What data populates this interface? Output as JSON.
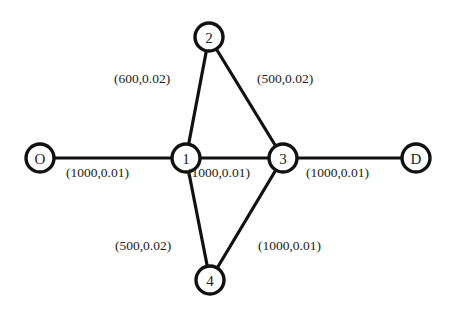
{
  "diagram": {
    "type": "network-graph",
    "nodes": [
      {
        "id": "O",
        "label": "O",
        "x": 40,
        "y": 158
      },
      {
        "id": "1",
        "label": "1",
        "x": 186,
        "y": 158
      },
      {
        "id": "2",
        "label": "2",
        "x": 209,
        "y": 37
      },
      {
        "id": "3",
        "label": "3",
        "x": 283,
        "y": 158
      },
      {
        "id": "4",
        "label": "4",
        "x": 210,
        "y": 280
      },
      {
        "id": "D",
        "label": "D",
        "x": 416,
        "y": 158
      }
    ],
    "edges": [
      {
        "from": "O",
        "to": "1",
        "label": "(1000,0.01)",
        "lx": 66,
        "ly": 172
      },
      {
        "from": "1",
        "to": "2",
        "label": "(600,0.02)",
        "lx": 114,
        "ly": 78
      },
      {
        "from": "2",
        "to": "3",
        "label": "(500,0.02)",
        "lx": 257,
        "ly": 78
      },
      {
        "from": "1",
        "to": "3",
        "label": "(1000,0.01)",
        "lx": 187,
        "ly": 172
      },
      {
        "from": "3",
        "to": "D",
        "label": "(1000,0.01)",
        "lx": 306,
        "ly": 172
      },
      {
        "from": "1",
        "to": "4",
        "label": "(500,0.02)",
        "lx": 115,
        "ly": 245
      },
      {
        "from": "3",
        "to": "4",
        "label": "(1000,0.01)",
        "lx": 258,
        "ly": 245
      }
    ]
  }
}
